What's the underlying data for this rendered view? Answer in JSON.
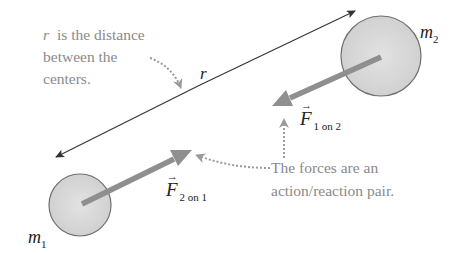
{
  "diagram": {
    "masses": [
      {
        "id": "m1",
        "label": "m",
        "subscript": "1"
      },
      {
        "id": "m2",
        "label": "m",
        "subscript": "2"
      }
    ],
    "distance": {
      "label": "r"
    },
    "annotation_distance": {
      "lines": [
        "is the distance",
        "between the",
        "centers."
      ],
      "leading_var": "r"
    },
    "forces": [
      {
        "id": "F2on1",
        "symbol": "F",
        "subscript": "2 on 1",
        "arrow": "→"
      },
      {
        "id": "F1on2",
        "symbol": "F",
        "subscript": "1 on 2",
        "arrow": "→"
      }
    ],
    "annotation_forces": {
      "lines": [
        "The forces are an",
        "action/reaction pair."
      ]
    },
    "colors": {
      "sphere_fill": "#d8d8d8",
      "sphere_stroke": "#6e6e6e",
      "force_arrow": "#8f8f8f",
      "note_text": "#8a8a8a",
      "line": "#333333",
      "dotted": "#9a9a9a"
    }
  }
}
